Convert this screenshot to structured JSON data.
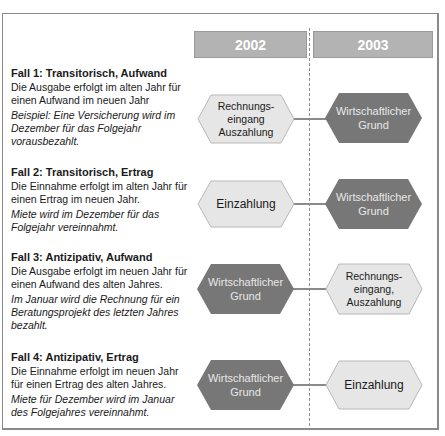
{
  "timeline": {
    "years": [
      "2002",
      "2003"
    ]
  },
  "cases": [
    {
      "title": "Fall 1: Transitorisch, Aufwand",
      "description": "Die Ausgabe erfolgt im alten Jahr für einen Aufwand im neuen Jahr",
      "example": "Beispiel: Eine Versicherung wird im Dezember für das Folgejahr vorausbezahlt.",
      "left_node": {
        "label": "Rechnungs-\neingang\nAuszahlung",
        "style": "light"
      },
      "right_node": {
        "label": "Wirtschaftlicher\nGrund",
        "style": "dark"
      }
    },
    {
      "title": "Fall 2: Transitorisch, Ertrag",
      "description": "Die Einnahme erfolgt im alten Jahr für einen Ertrag im neuen Jahr.",
      "example": "Miete wird im Dezember für das Folgejahr vereinnahmt.",
      "left_node": {
        "label": "Einzahlung",
        "style": "light"
      },
      "right_node": {
        "label": "Wirtschaftlicher\nGrund",
        "style": "dark"
      }
    },
    {
      "title": "Fall 3: Antizipativ, Aufwand",
      "description": "Die Ausgabe erfolgt im neuen Jahr für einen Aufwand des alten Jahres.",
      "example": "Im Januar wird die Rechnung für ein Beratungsprojekt des letzten Jahres bezahlt.",
      "left_node": {
        "label": "Wirtschaftlicher\nGrund",
        "style": "dark"
      },
      "right_node": {
        "label": "Rechnungs-\neingang,\nAuszahlung",
        "style": "light"
      }
    },
    {
      "title": "Fall 4: Antizipativ, Ertrag",
      "description": "Die Einnahme erfolgt im neuen Jahr für einen Ertrag des alten Jahres.",
      "example": "Miete für Dezember wird im Januar des Folgejahres vereinnahmt.",
      "left_node": {
        "label": "Wirtschaftlicher\nGrund",
        "style": "dark"
      },
      "right_node": {
        "label": "Einzahlung",
        "style": "light"
      }
    }
  ],
  "colors": {
    "year_bar": "#b3b3b3",
    "hex_light_fill": "#e6e6e6",
    "hex_light_stroke": "#b8b8b8",
    "hex_dark_fill": "#777777",
    "connector": "#8a8a8a"
  }
}
